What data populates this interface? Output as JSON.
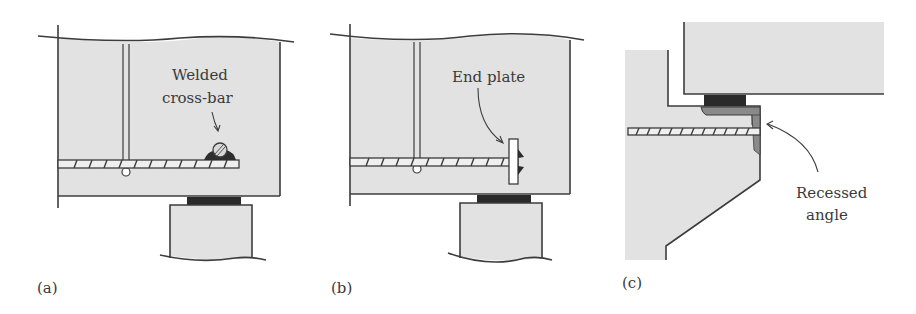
{
  "figure": {
    "panels": [
      {
        "id": "a",
        "caption": "(a)",
        "annotation": [
          "Welded",
          "cross-bar"
        ],
        "detail": "welded cross-bar anchorage"
      },
      {
        "id": "b",
        "caption": "(b)",
        "annotation": [
          "End plate"
        ],
        "detail": "end plate anchorage"
      },
      {
        "id": "c",
        "caption": "(c)",
        "annotation": [
          "Recessed",
          "angle"
        ],
        "detail": "recessed angle at corbel"
      }
    ],
    "colors": {
      "concrete": "#e2e2e2",
      "outline": "#3c3c3c",
      "bearing_pad": "#2a2a2a",
      "angle": "#8a8a8a",
      "text": "#3a3a3a"
    }
  }
}
